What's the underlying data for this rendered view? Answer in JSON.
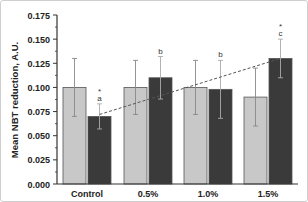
{
  "chart_data": {
    "type": "bar",
    "title": "",
    "xlabel": "",
    "ylabel": "Mean NBT reduction, A.U.",
    "ylim": [
      0,
      0.175
    ],
    "yticks": [
      "0.000",
      "0.025",
      "0.050",
      "0.075",
      "0.100",
      "0.125",
      "0.150",
      "0.175"
    ],
    "categories": [
      "Control",
      "0.5%",
      "1.0%",
      "1.5%"
    ],
    "series": [
      {
        "name": "series-light",
        "color": "#c8c8c8",
        "values": [
          0.1,
          0.1,
          0.1,
          0.09
        ],
        "errors": [
          0.03,
          0.028,
          0.028,
          0.03
        ]
      },
      {
        "name": "series-dark",
        "color": "#3a3a3a",
        "values": [
          0.07,
          0.11,
          0.098,
          0.13
        ],
        "errors": [
          0.013,
          0.022,
          0.03,
          0.02
        ]
      }
    ],
    "annotations": [
      {
        "category": "Control",
        "series": "series-dark",
        "text": [
          "*",
          "a"
        ]
      },
      {
        "category": "0.5%",
        "series": "series-dark",
        "text": [
          "b"
        ]
      },
      {
        "category": "1.0%",
        "series": "series-dark",
        "text": [
          "b"
        ]
      },
      {
        "category": "1.5%",
        "series": "series-dark",
        "text": [
          "*",
          "c"
        ]
      }
    ],
    "trendline": {
      "style": "dashed",
      "from": {
        "category": "Control",
        "y": 0.072
      },
      "to": {
        "category": "1.5%",
        "y": 0.13
      }
    },
    "grid": false,
    "legend": null
  }
}
